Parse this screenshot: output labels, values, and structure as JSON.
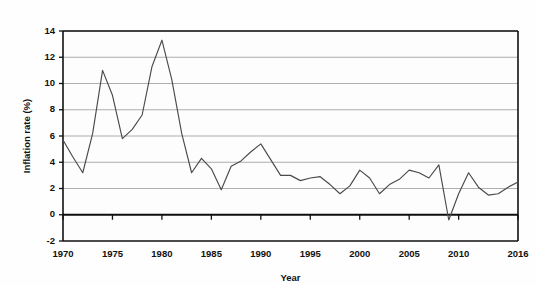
{
  "chart_data": {
    "type": "line",
    "title": "",
    "xlabel": "Year",
    "ylabel": "Inflation rate (%)",
    "xlim": [
      1970,
      2016
    ],
    "ylim": [
      -2,
      14
    ],
    "grid": true,
    "legend": "none",
    "line_color": "#4a4a4a",
    "gridline_color": "#8c8c8c",
    "axis_color": "#111111",
    "background_color": "#fdfdfd",
    "ytick_labels": [
      "14",
      "12",
      "10",
      "8",
      "6",
      "4",
      "2",
      "0",
      "-2"
    ],
    "yticks": [
      14,
      12,
      10,
      8,
      6,
      4,
      2,
      0,
      -2
    ],
    "xtick_labels": [
      "1970",
      "1975",
      "1980",
      "1985",
      "1990",
      "1995",
      "2000",
      "2005",
      "2010",
      "2016"
    ],
    "xticks": [
      1970,
      1975,
      1980,
      1985,
      1990,
      1995,
      2000,
      2005,
      2010,
      2016
    ],
    "x": [
      1970,
      1971,
      1972,
      1973,
      1974,
      1975,
      1976,
      1977,
      1978,
      1979,
      1980,
      1981,
      1982,
      1983,
      1984,
      1985,
      1986,
      1987,
      1988,
      1989,
      1990,
      1991,
      1992,
      1993,
      1994,
      1995,
      1996,
      1997,
      1998,
      1999,
      2000,
      2001,
      2002,
      2003,
      2004,
      2005,
      2006,
      2007,
      2008,
      2009,
      2010,
      2011,
      2012,
      2013,
      2014,
      2015,
      2016
    ],
    "values": [
      5.7,
      4.4,
      3.2,
      6.2,
      11.0,
      9.1,
      5.8,
      6.5,
      7.6,
      11.3,
      13.3,
      10.3,
      6.2,
      3.2,
      4.3,
      3.5,
      1.9,
      3.7,
      4.1,
      4.8,
      5.4,
      4.2,
      3.0,
      3.0,
      2.6,
      2.8,
      2.9,
      2.3,
      1.6,
      2.2,
      3.4,
      2.8,
      1.6,
      2.3,
      2.7,
      3.4,
      3.2,
      2.8,
      3.8,
      -0.4,
      1.6,
      3.2,
      2.1,
      1.5,
      1.6,
      2.1,
      2.5
    ],
    "series_name": "Inflation rate"
  }
}
